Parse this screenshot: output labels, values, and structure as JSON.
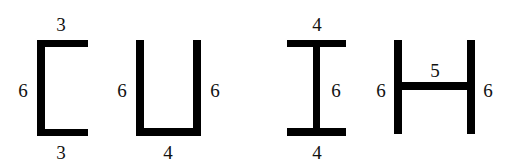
{
  "colors": {
    "stroke": "#000000",
    "text": "#111111",
    "background": "#ffffff"
  },
  "shapes": [
    {
      "id": "C",
      "labels": {
        "top": "3",
        "left": "6",
        "bottom": "3"
      }
    },
    {
      "id": "U",
      "labels": {
        "left": "6",
        "right": "6",
        "bottom": "4"
      }
    },
    {
      "id": "I",
      "labels": {
        "top": "4",
        "middle": "6",
        "bottom": "4"
      }
    },
    {
      "id": "H",
      "labels": {
        "left": "6",
        "middle": "5",
        "right": "6"
      }
    }
  ]
}
